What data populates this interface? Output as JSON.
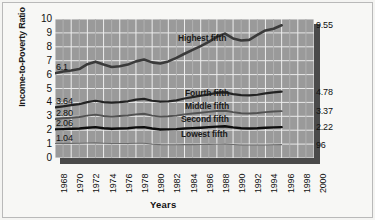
{
  "chart_data": {
    "type": "line",
    "title": "",
    "xlabel": "Years",
    "ylabel": "Income-to-Poverty Ratio",
    "xlim": [
      1968,
      2000
    ],
    "ylim": [
      0,
      10
    ],
    "grid": true,
    "legend_position": "inline-labels",
    "x_ticks": [
      "1968",
      "1970",
      "1972",
      "1974",
      "1976",
      "1978",
      "1980",
      "1982",
      "1984",
      "1986",
      "1988",
      "1990",
      "1992",
      "1994",
      "1996",
      "1998",
      "2000"
    ],
    "y_ticks": [
      "10",
      "9",
      "8",
      "7",
      "6",
      "5",
      "4",
      "3",
      "2",
      "1",
      "0"
    ],
    "x": [
      1968,
      1969,
      1970,
      1971,
      1972,
      1973,
      1974,
      1975,
      1976,
      1977,
      1978,
      1979,
      1980,
      1981,
      1982,
      1983,
      1984,
      1985,
      1986,
      1987,
      1988,
      1989,
      1990,
      1991,
      1992,
      1993,
      1994,
      1995,
      1996
    ],
    "series": [
      {
        "name": "Highest fifth",
        "color": "#3a3a3a",
        "width": 2.6,
        "start_value": "6.1",
        "end_value": "9.55",
        "values": [
          6.1,
          6.22,
          6.3,
          6.4,
          6.75,
          6.92,
          6.72,
          6.55,
          6.6,
          6.72,
          6.95,
          7.08,
          6.88,
          6.8,
          6.95,
          7.2,
          7.5,
          7.78,
          8.05,
          8.35,
          8.72,
          8.95,
          8.6,
          8.45,
          8.5,
          8.85,
          9.18,
          9.3,
          9.55
        ]
      },
      {
        "name": "Fourth fifth",
        "color": "#232323",
        "width": 2.2,
        "start_value": "3.64",
        "end_value": "4.78",
        "values": [
          3.64,
          3.72,
          3.8,
          3.88,
          4.02,
          4.12,
          4.02,
          3.98,
          4.02,
          4.08,
          4.2,
          4.25,
          4.12,
          4.05,
          4.08,
          4.15,
          4.28,
          4.38,
          4.48,
          4.58,
          4.68,
          4.72,
          4.6,
          4.52,
          4.5,
          4.55,
          4.65,
          4.72,
          4.78
        ]
      },
      {
        "name": "Middle fifth",
        "color": "#525252",
        "width": 1.9,
        "start_value": "2.80",
        "end_value": "3.37",
        "values": [
          2.8,
          2.86,
          2.9,
          2.95,
          3.05,
          3.12,
          3.02,
          2.98,
          3.02,
          3.06,
          3.14,
          3.18,
          3.05,
          2.98,
          3.0,
          3.05,
          3.14,
          3.2,
          3.26,
          3.32,
          3.38,
          3.4,
          3.3,
          3.22,
          3.2,
          3.24,
          3.3,
          3.34,
          3.37
        ]
      },
      {
        "name": "Second fifth",
        "color": "#0d0d0d",
        "width": 2.4,
        "start_value": "2.06",
        "end_value": "2.22",
        "values": [
          2.06,
          2.08,
          2.1,
          2.12,
          2.18,
          2.22,
          2.14,
          2.1,
          2.12,
          2.14,
          2.2,
          2.22,
          2.12,
          2.05,
          2.06,
          2.08,
          2.12,
          2.15,
          2.18,
          2.22,
          2.26,
          2.28,
          2.2,
          2.14,
          2.12,
          2.14,
          2.18,
          2.2,
          2.22
        ]
      },
      {
        "name": "Lowest fifth",
        "color": "#6b6b6b",
        "width": 1.1,
        "start_value": "1.04",
        "end_value": "96",
        "values": [
          1.04,
          1.05,
          1.05,
          1.06,
          1.08,
          1.09,
          1.06,
          1.04,
          1.04,
          1.04,
          1.06,
          1.06,
          1.0,
          0.96,
          0.95,
          0.95,
          0.96,
          0.96,
          0.97,
          0.98,
          0.99,
          1.0,
          0.97,
          0.94,
          0.93,
          0.93,
          0.94,
          0.95,
          0.96
        ]
      }
    ]
  }
}
